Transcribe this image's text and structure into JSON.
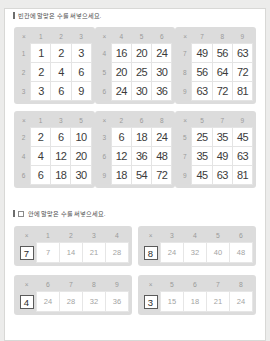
{
  "page": {
    "background": "#ececeb",
    "sheet_color": "#ffffff"
  },
  "sections": [
    {
      "marker": "▏",
      "heading": "빈칸에 알맞은 수를 써넣으세요.",
      "has_box_glyph": false
    },
    {
      "marker": "▏",
      "heading": "안에 알맞은 수를 써넣으세요.",
      "has_box_glyph": true
    }
  ],
  "symbols": {
    "times": "×"
  },
  "chart_data": {
    "type": "table",
    "tables": [
      {
        "id": "t1",
        "corner": "×",
        "columns": [
          "1",
          "2",
          "3"
        ],
        "rows": [
          "1",
          "2",
          "3"
        ],
        "values": [
          [
            "1",
            "2",
            "3"
          ],
          [
            "2",
            "4",
            "6"
          ],
          [
            "3",
            "6",
            "9"
          ]
        ]
      },
      {
        "id": "t2",
        "corner": "×",
        "columns": [
          "4",
          "5",
          "6"
        ],
        "rows": [
          "4",
          "5",
          "6"
        ],
        "values": [
          [
            "16",
            "20",
            "24"
          ],
          [
            "20",
            "25",
            "30"
          ],
          [
            "24",
            "30",
            "36"
          ]
        ]
      },
      {
        "id": "t3",
        "corner": "×",
        "columns": [
          "7",
          "8",
          "9"
        ],
        "rows": [
          "7",
          "8",
          "9"
        ],
        "values": [
          [
            "49",
            "56",
            "63"
          ],
          [
            "56",
            "64",
            "72"
          ],
          [
            "63",
            "72",
            "81"
          ]
        ]
      },
      {
        "id": "t4",
        "corner": "×",
        "columns": [
          "1",
          "3",
          "5"
        ],
        "rows": [
          "2",
          "4",
          "6"
        ],
        "values": [
          [
            "2",
            "6",
            "10"
          ],
          [
            "4",
            "12",
            "20"
          ],
          [
            "6",
            "18",
            "30"
          ]
        ]
      },
      {
        "id": "t5",
        "corner": "×",
        "columns": [
          "2",
          "6",
          "8"
        ],
        "rows": [
          "3",
          "6",
          "9"
        ],
        "values": [
          [
            "6",
            "18",
            "24"
          ],
          [
            "12",
            "36",
            "48"
          ],
          [
            "18",
            "54",
            "72"
          ]
        ]
      },
      {
        "id": "t6",
        "corner": "×",
        "columns": [
          "5",
          "7",
          "9"
        ],
        "rows": [
          "5",
          "7",
          "9"
        ],
        "values": [
          [
            "25",
            "35",
            "45"
          ],
          [
            "35",
            "49",
            "63"
          ],
          [
            "45",
            "63",
            "81"
          ]
        ]
      }
    ],
    "fill_in_tables": [
      {
        "id": "f1",
        "corner": "×",
        "columns": [
          "1",
          "2",
          "3",
          "4"
        ],
        "answer": "7",
        "values": [
          "7",
          "14",
          "21",
          "28"
        ]
      },
      {
        "id": "f2",
        "corner": "×",
        "columns": [
          "3",
          "4",
          "5",
          "6"
        ],
        "answer": "8",
        "values": [
          "24",
          "32",
          "40",
          "48"
        ]
      },
      {
        "id": "f3",
        "corner": "×",
        "columns": [
          "6",
          "7",
          "8",
          "9"
        ],
        "answer": "4",
        "values": [
          "24",
          "28",
          "32",
          "36"
        ]
      },
      {
        "id": "f4",
        "corner": "×",
        "columns": [
          "5",
          "6",
          "7",
          "8"
        ],
        "answer": "3",
        "values": [
          "15",
          "18",
          "21",
          "24"
        ]
      }
    ]
  }
}
